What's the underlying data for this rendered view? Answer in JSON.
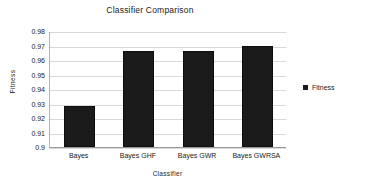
{
  "chart_data": {
    "type": "bar",
    "title": "Classifier Comparison",
    "xlabel": "Classifier",
    "ylabel": "Fitness",
    "categories": [
      "Bayes",
      "Bayes GHF",
      "Bayes GWR",
      "Bayes GWRSA"
    ],
    "values": [
      0.9285,
      0.9663,
      0.9663,
      0.9697
    ],
    "series": [
      {
        "name": "Fitness",
        "values": [
          0.9285,
          0.9663,
          0.9663,
          0.9697
        ]
      }
    ],
    "ylim": [
      0.9,
      0.98
    ],
    "ytick_step": 0.01,
    "yticks": [
      0.9,
      0.91,
      0.92,
      0.93,
      0.94,
      0.95,
      0.96,
      0.97,
      0.98
    ],
    "ytick_labels": [
      "0.9",
      "0.91",
      "0.92",
      "0.93",
      "0.94",
      "0.95",
      "0.96",
      "0.97",
      "0.98"
    ],
    "grid": true,
    "grid_axis": "y",
    "legend": {
      "position": "right",
      "entries": [
        "Fitness"
      ]
    },
    "colors": {
      "bar": "#1b1b1b",
      "gridline": "#d9d9d9",
      "axis": "#9a9a9a",
      "text": "#1a1a1a",
      "background": "#ffffff"
    }
  }
}
